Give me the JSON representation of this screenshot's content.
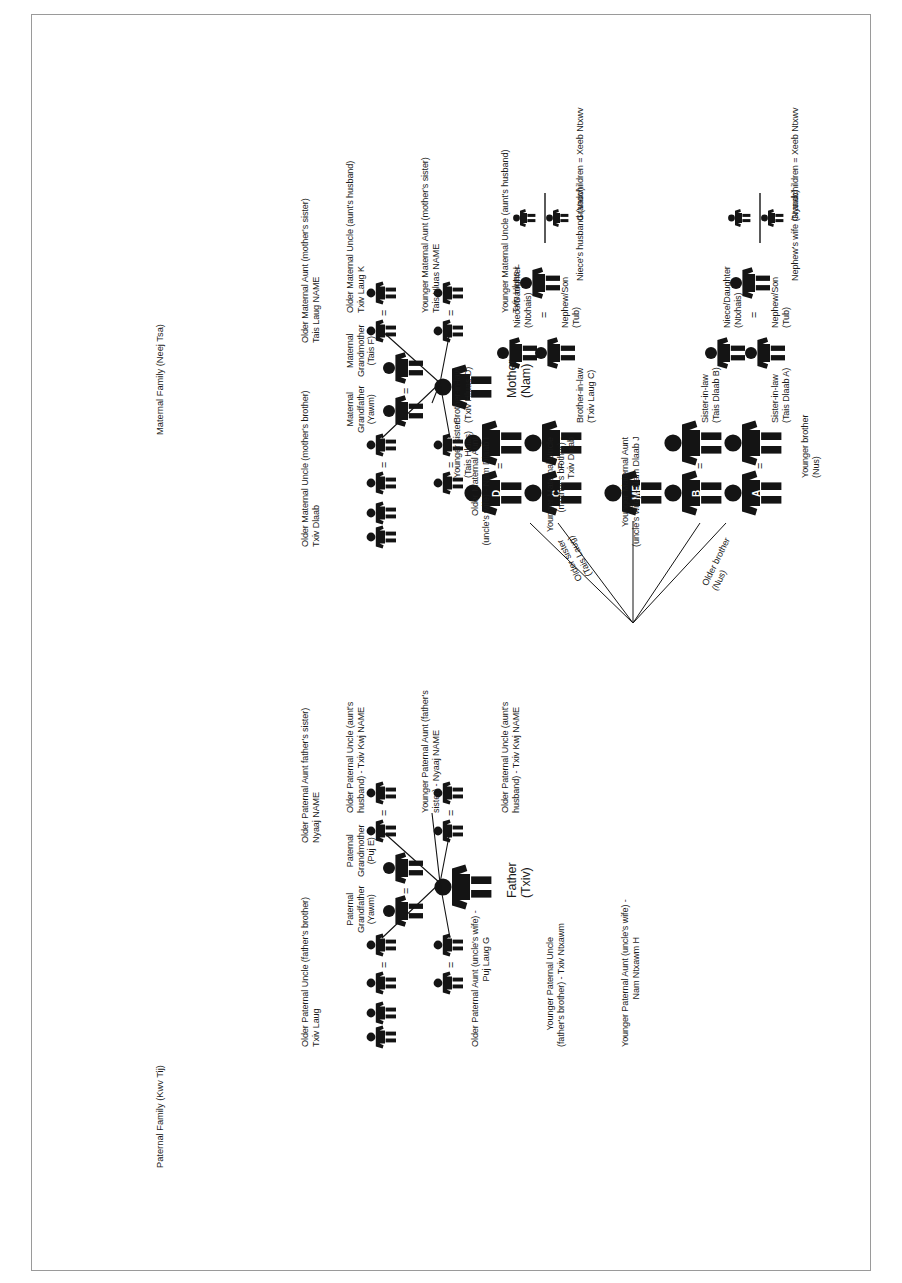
{
  "titles": {
    "paternal": "Paternal Family (Kwv Tij)",
    "maternal": "Maternal Family (Neej Tsa)"
  },
  "paternal": {
    "grandfather": "Paternal\nGrandfather\n(Yawm)",
    "grandmother": "Paternal\nGrandmother\n(Puj E)",
    "father": "Father\n(Txiv)",
    "uncle_older": "Older Paternal Uncle (father's brother)\nTxiv Laug",
    "aunt_older_wife": "Older Paternal Aunt (uncle's wife) -\nPuj Laug G",
    "uncle_younger": "Younger Paternal Uncle\n(father's brother) - Txiv Ntxawm",
    "aunt_younger_wife": "Younger Paternal Aunt (uncle's wife) -\nNam Ntxawm H",
    "aunt_older": "Older Paternal Aunt father's sister)\nNyaaj NAME",
    "uncle_older_byaunt": "Older Paternal Uncle (aunt's\nhusband) - Txiv Kwj NAME",
    "aunt_younger": "Younger Paternal Aunt (father's\nsister) - Nyaaj NAME",
    "uncle_younger_byaunt": "Older Paternal Uncle (aunt's\nhusband) - Txiv Kwj NAME"
  },
  "maternal": {
    "grandfather": "Maternal\nGrandfather\n(Yawm)",
    "grandmother": "Maternal\nGrandmother\n(Tais F)",
    "mother": "Mother\n(Nam)",
    "uncle_older": "Older Maternal Uncle (mother's brother)\nTxiv Dlaab",
    "aunt_older_wife": "Older Maternal Aunt\n(uncle's wife) - Nam Dlaab I",
    "uncle_younger": "Younger Maternal Uncle\n(mother's brother) -\nTxiv Dlaab",
    "aunt_younger_wife": "Younger Maternal Aunt\n(uncle's wife) - Nam Dlaab J",
    "aunt_older": "Older Maternal Aunt (mother's sister)\nTais Laug NAME",
    "uncle_older_byaunt": "Older Maternal Uncle (aunt's husband)\nTxiv Laug K",
    "aunt_younger": "Younger Maternal Aunt (mother's sister)\nTais Hluas NAME",
    "uncle_younger_byaunt": "Younger Maternal Uncle (aunt's husband)\nTxiv Hluas L"
  },
  "ego": {
    "label": "ME"
  },
  "siblings": {
    "older_sister": "Older sister\n(Tais Laug)",
    "older_brother": "Older brother\n(Nus)",
    "younger_brother": "Younger brother\n(Nus)",
    "younger_sister": "Younger sister\n(Tais Hluas)",
    "brother_in_law_c": "Brother-in-law\n(Txiv Laug C)",
    "brother_in_law_d": "Brother-in-law\n(Txiv Hluas D)",
    "sister_in_law_a": "Sister-in-law\n(Tais Dlaab A)",
    "sister_in_law_b": "Sister-in-law\n(Tais Dlaab B)"
  },
  "spouse_marks": {
    "A": "A",
    "B": "B",
    "C": "C",
    "D": "D"
  },
  "descendants": {
    "nephew_son_left": "Nephew/Son\n(Tub)",
    "niece_daughter_left": "Niece/Daughter\n(Ntxhais)",
    "nephew_son_right": "Nephew/Son\n(Tub)",
    "niece_daughter_right": "Niece/Daughter\n(Ntxhais)",
    "nephews_wife": "Nephew's wife (Nyaab)",
    "nieces_husband": "Niece's husband (Vauv)",
    "grandchildren_left": "Grandchildren = Xeeb Ntxwv",
    "grandchildren_right": "Grandchildren = Xeeb Ntxwv"
  },
  "symbols": {
    "marriage": "=",
    "equals_sign": "="
  },
  "colors": {
    "ink": "#1b1b1b",
    "page_border": "#9a9a9a",
    "background": "#ffffff"
  }
}
